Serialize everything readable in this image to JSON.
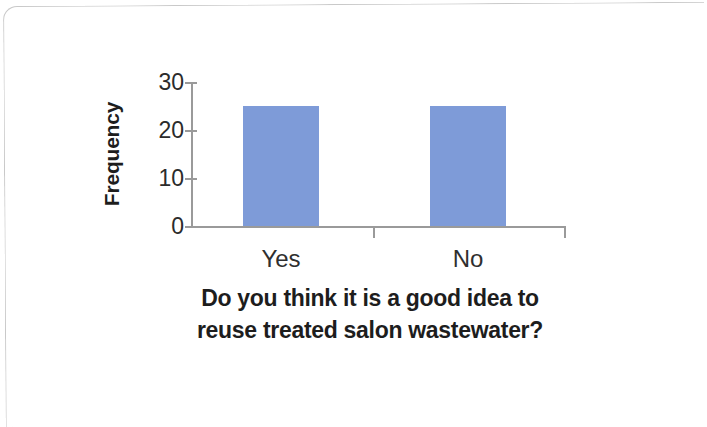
{
  "chart_data": {
    "type": "bar",
    "title": "",
    "subtitle": "",
    "categories": [
      "Yes",
      "No"
    ],
    "values": [
      25,
      25
    ],
    "series": [
      {
        "name": "Frequency",
        "values": [
          25,
          25
        ]
      }
    ],
    "xlabel_lines": [
      "Do you think it is a good idea to",
      "reuse treated salon wastewater?"
    ],
    "xlabel": "Do you think it is a good idea to reuse treated salon wastewater?",
    "ylabel": "Frequency",
    "ylim": [
      0,
      30
    ],
    "yticks": [
      0,
      10,
      20,
      30
    ],
    "ytick_labels": [
      "0",
      "10",
      "20",
      "30"
    ],
    "grid": false,
    "legend": false,
    "legend_position": "none",
    "bar_color": "#7e9bd8",
    "axis_color": "#9a9a9a",
    "text_color": "#1d1d1d"
  },
  "axes": {
    "y_title": "Frequency",
    "y_tick_0": "0",
    "y_tick_1": "10",
    "y_tick_2": "20",
    "y_tick_3": "30",
    "x_cat_0": "Yes",
    "x_cat_1": "No",
    "x_title_line_1": "Do you think it is a good idea to",
    "x_title_line_2": "reuse treated salon wastewater?"
  }
}
